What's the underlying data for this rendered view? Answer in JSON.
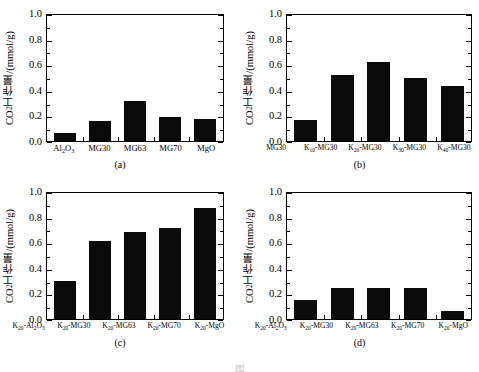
{
  "figure": {
    "caption_visible_fragment": "图",
    "background_color": "#ffffff",
    "bar_color": "#0a0a0a",
    "axis_color": "#000000"
  },
  "axis": {
    "ylabel_prefix": "CO",
    "ylabel_sub": "2",
    "ylabel_suffix": "工作量/(mmol/g)",
    "yticks": [
      "0.0",
      "0.2",
      "0.4",
      "0.6",
      "0.8",
      "1.0"
    ],
    "ymin": 0.0,
    "ymax": 1.0
  },
  "panels": {
    "a": {
      "tag": "(a)",
      "labels": [
        {
          "main": "Al",
          "sub": "2",
          "main2": "O",
          "sub2": "3"
        },
        {
          "main": "MG30"
        },
        {
          "main": "MG63"
        },
        {
          "main": "MG70"
        },
        {
          "main": "MgO"
        }
      ]
    },
    "b": {
      "tag": "(b)",
      "labels": [
        {
          "main": "MG30"
        },
        {
          "main": "K",
          "sub": "10",
          "main2": "-MG30"
        },
        {
          "main": "K",
          "sub": "20",
          "main2": "-MG30"
        },
        {
          "main": "K",
          "sub": "30",
          "main2": "-MG30"
        },
        {
          "main": "K",
          "sub": "40",
          "main2": "-MG30"
        }
      ]
    },
    "c": {
      "tag": "(c)",
      "labels": [
        {
          "main": "K",
          "sub": "20",
          "main2": "-Al",
          "sub2": "2",
          "main3": "O",
          "sub3": "3"
        },
        {
          "main": "K",
          "sub": "20",
          "main2": "-MG30"
        },
        {
          "main": "K",
          "sub": "20",
          "main2": "-MG63"
        },
        {
          "main": "K",
          "sub": "20",
          "main2": "-MG70"
        },
        {
          "main": "K",
          "sub": "20",
          "main2": "-MgO"
        }
      ]
    },
    "d": {
      "tag": "(d)",
      "labels": [
        {
          "main": "K",
          "sub": "20",
          "main2": "-Al",
          "sub2": "2",
          "main3": "O",
          "sub3": "3"
        },
        {
          "main": "K",
          "sub": "20",
          "main2": "-MG30"
        },
        {
          "main": "K",
          "sub": "20",
          "main2": "-MG63"
        },
        {
          "main": "K",
          "sub": "20",
          "main2": "-MG70"
        },
        {
          "main": "K",
          "sub": "20",
          "main2": "-MgO"
        }
      ]
    }
  },
  "chart_data": [
    {
      "type": "bar",
      "panel": "(a)",
      "title": "",
      "categories": [
        "Al2O3",
        "MG30",
        "MG63",
        "MG70",
        "MgO"
      ],
      "values": [
        0.065,
        0.16,
        0.32,
        0.19,
        0.175
      ],
      "xlabel": "",
      "ylabel": "CO2工作量/(mmol/g)",
      "ylim": [
        0.0,
        1.0
      ],
      "yticks": [
        0.0,
        0.2,
        0.4,
        0.6,
        0.8,
        1.0
      ],
      "grid": false,
      "legend": "none"
    },
    {
      "type": "bar",
      "panel": "(b)",
      "title": "",
      "categories": [
        "MG30",
        "K10-MG30",
        "K20-MG30",
        "K30-MG30",
        "K40-MG30"
      ],
      "values": [
        0.165,
        0.52,
        0.625,
        0.5,
        0.435
      ],
      "xlabel": "",
      "ylabel": "CO2工作量/(mmol/g)",
      "ylim": [
        0.0,
        1.0
      ],
      "yticks": [
        0.0,
        0.2,
        0.4,
        0.6,
        0.8,
        1.0
      ],
      "grid": false,
      "legend": "none"
    },
    {
      "type": "bar",
      "panel": "(c)",
      "title": "",
      "categories": [
        "K20-Al2O3",
        "K20-MG30",
        "K20-MG63",
        "K20-MG70",
        "K20-MgO"
      ],
      "values": [
        0.3,
        0.62,
        0.69,
        0.72,
        0.88
      ],
      "xlabel": "",
      "ylabel": "CO2工作量/(mmol/g)",
      "ylim": [
        0.0,
        1.0
      ],
      "yticks": [
        0.0,
        0.2,
        0.4,
        0.6,
        0.8,
        1.0
      ],
      "grid": false,
      "legend": "none"
    },
    {
      "type": "bar",
      "panel": "(d)",
      "title": "",
      "categories": [
        "K20-Al2O3",
        "K20-MG30",
        "K20-MG63",
        "K20-MG70",
        "K20-MgO"
      ],
      "values": [
        0.15,
        0.25,
        0.25,
        0.25,
        0.06
      ],
      "xlabel": "",
      "ylabel": "CO2工作量/(mmol/g)",
      "ylim": [
        0.0,
        1.0
      ],
      "yticks": [
        0.0,
        0.2,
        0.4,
        0.6,
        0.8,
        1.0
      ],
      "grid": false,
      "legend": "none"
    }
  ]
}
